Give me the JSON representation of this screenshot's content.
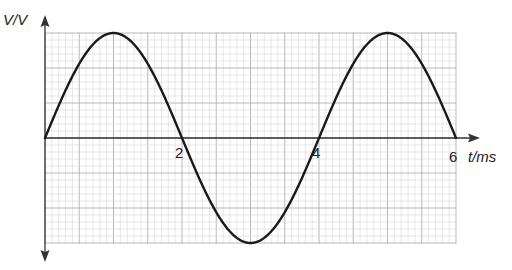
{
  "chart_data": {
    "type": "line",
    "title": "",
    "xlabel": "t/ms",
    "ylabel": "V/V",
    "x_ticks": [
      2,
      4,
      6
    ],
    "x_tick_labels": [
      "2",
      "4",
      "6"
    ],
    "xlim": [
      0,
      6
    ],
    "grid": true,
    "legend": null,
    "series": [
      {
        "name": "V(t)",
        "function": "sine",
        "period_ms": 4,
        "amplitude_grid_units": 15,
        "x": [
          0,
          0.5,
          1,
          1.5,
          2,
          2.5,
          3,
          3.5,
          4,
          4.5,
          5,
          5.5,
          6
        ],
        "y": [
          0,
          0.707,
          1,
          0.707,
          0,
          -0.707,
          -1,
          -0.707,
          0,
          0.707,
          1,
          0.707,
          0
        ]
      }
    ]
  },
  "axes": {
    "y_label": "V/V",
    "x_label": "t/ms",
    "ticks": [
      "2",
      "4",
      "6"
    ]
  },
  "colors": {
    "curve": "#1a1a1a",
    "axis": "#333333",
    "grid_minor": "#d6d6d6",
    "grid_major": "#b0b0b0"
  }
}
